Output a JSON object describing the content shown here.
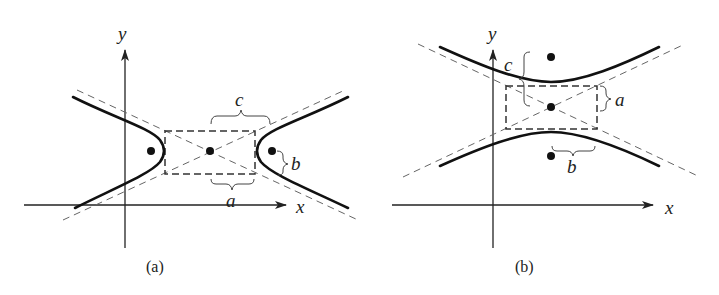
{
  "figure": {
    "panels": [
      {
        "id": "a",
        "caption": "(a)",
        "orientation": "horizontal transverse axis",
        "axis_labels": {
          "x": "x",
          "y": "y"
        },
        "labels": {
          "c": "c",
          "a": "a",
          "b": "b"
        },
        "elements": [
          "two branches opening left/right",
          "dashed central rectangle",
          "two dashed asymptotes",
          "three points: left focus, center, right focus"
        ]
      },
      {
        "id": "b",
        "caption": "(b)",
        "orientation": "vertical transverse axis",
        "axis_labels": {
          "x": "x",
          "y": "y"
        },
        "labels": {
          "c": "c",
          "a": "a",
          "b": "b"
        },
        "elements": [
          "two branches opening up/down",
          "dashed central rectangle",
          "two dashed asymptotes",
          "three points: top focus, center, bottom focus"
        ]
      }
    ]
  }
}
